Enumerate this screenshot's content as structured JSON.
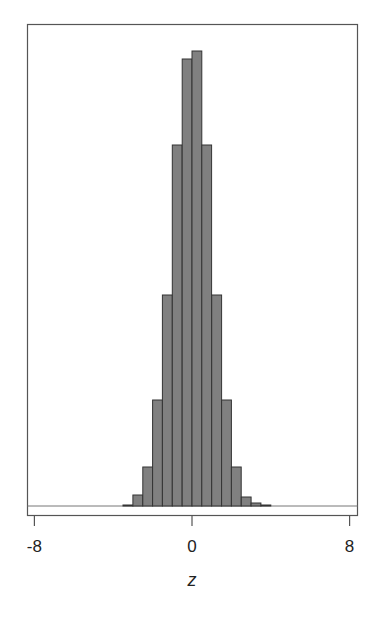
{
  "chart_data": {
    "type": "bar",
    "title": "",
    "xlabel": "z",
    "ylabel": "",
    "xlim": [
      -8.4,
      8.4
    ],
    "x_ticks": [
      -8,
      0,
      8
    ],
    "x_tick_labels": [
      "-8",
      "0",
      "8"
    ],
    "y_ticks": [],
    "grid": false,
    "legend": null,
    "bin_width": 0.5,
    "bin_edges": [
      -3.5,
      -3.0,
      -2.5,
      -2.0,
      -1.5,
      -1.0,
      -0.5,
      0.0,
      0.5,
      1.0,
      1.5,
      2.0,
      2.5,
      3.0,
      3.5,
      4.0
    ],
    "categories": [
      "-3.5",
      "-3.0",
      "-2.5",
      "-2.0",
      "-1.5",
      "-1.0",
      "-0.5",
      "0.0",
      "0.5",
      "1.0",
      "1.5",
      "2.0",
      "2.5",
      "3.0",
      "3.5"
    ],
    "values": [
      1,
      11,
      39,
      106,
      211,
      361,
      447,
      455,
      361,
      211,
      106,
      39,
      9,
      3,
      1
    ],
    "values_note": "relative bar heights (no y-axis shown)",
    "colors": {
      "bar_fill": "#808080",
      "bar_edge": "#333333",
      "frame": "#555555"
    }
  }
}
